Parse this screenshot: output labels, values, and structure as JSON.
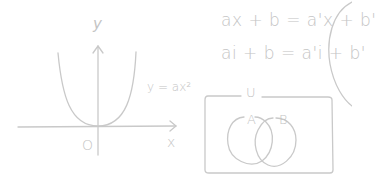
{
  "colors": {
    "stroke": "#c8c8c8",
    "text": "#c4c4c4",
    "background": "#ffffff"
  },
  "equations": {
    "line1": "ax + b = a'x + b'",
    "line2": "ai + b = a'i + b'"
  },
  "graph": {
    "y_axis_label": "y",
    "x_axis_label": "x",
    "origin_label": "O",
    "curve_label": "y = ax²"
  },
  "venn": {
    "universe_label": "U",
    "set_a_label": "A",
    "set_b_label": "B"
  }
}
